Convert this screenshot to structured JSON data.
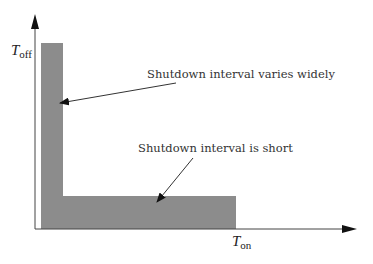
{
  "diagram": {
    "axes": {
      "y_label": "T",
      "y_label_sub": "off",
      "x_label": "T",
      "x_label_sub": "on"
    },
    "annotations": [
      {
        "text": "Shutdown interval varies widely"
      },
      {
        "text": "Shutdown interval is short"
      }
    ],
    "colors": {
      "region_fill": "#8c8c8c",
      "axis": "#333333",
      "text": "#333333"
    }
  }
}
